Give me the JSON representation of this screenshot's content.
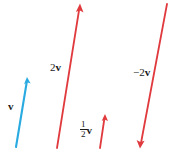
{
  "figure": {
    "background_color": "#ffffff",
    "width": 179,
    "height": 159,
    "colors": {
      "vector_v": "#29abe2",
      "scalar_multiples": "#e03a3e",
      "label_text": "#1a1a1a"
    },
    "labels": {
      "v": "v",
      "two_v": "2v",
      "two_v_coefficient": "2",
      "two_v_symbol": "v",
      "half_v_numerator": "1",
      "half_v_denominator": "2",
      "half_v_symbol": "v",
      "minus_two_v": "−2v",
      "minus_two_v_coefficient": "−2",
      "minus_two_v_symbol": "v"
    },
    "vectors": [
      {
        "name": "v",
        "label": "v",
        "color": "#29abe2",
        "tail": [
          16,
          147
        ],
        "tip": [
          27,
          78
        ],
        "arrowhead": "tip",
        "scalar": 1
      },
      {
        "name": "2v",
        "label": "2v",
        "color": "#e03a3e",
        "tail": [
          57,
          148
        ],
        "tip": [
          80,
          4
        ],
        "arrowhead": "tip",
        "scalar": 2
      },
      {
        "name": "half-v",
        "label": "1/2 v",
        "color": "#e03a3e",
        "tail": [
          100,
          148
        ],
        "tip": [
          105,
          114
        ],
        "arrowhead": "tip",
        "scalar": 0.5
      },
      {
        "name": "-2v",
        "label": "−2v",
        "color": "#e03a3e",
        "tail": [
          167,
          4
        ],
        "tip": [
          140,
          148
        ],
        "arrowhead": "tip",
        "scalar": -2
      }
    ]
  }
}
